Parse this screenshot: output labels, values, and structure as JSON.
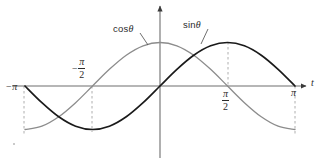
{
  "chart_data": {
    "type": "line",
    "title": "",
    "subtitle": "",
    "xlabel": "t",
    "ylabel": "",
    "xlim": [
      -3.141592653589793,
      3.141592653589793
    ],
    "ylim": [
      -1.15,
      1.15
    ],
    "grid": false,
    "legend_position": "inline-annotations",
    "x_tick_labels": [
      "−π",
      "−π/2",
      "π/2",
      "π"
    ],
    "x_tick_values": [
      -3.141592653589793,
      -1.5707963267948966,
      1.5707963267948966,
      3.141592653589793
    ],
    "series": [
      {
        "name": "cos θ",
        "color": "#8c8c8c",
        "linewidth": 1.3,
        "x": [
          -3.141592653589793,
          -2.748893571891069,
          -2.356194490192345,
          -1.9634954084936207,
          -1.5707963267948966,
          -1.1780972450961724,
          -0.7853981633974483,
          -0.39269908169872414,
          0,
          0.39269908169872414,
          0.7853981633974483,
          1.1780972450961724,
          1.5707963267948966,
          1.9634954084936207,
          2.356194490192345,
          2.748893571891069,
          3.141592653589793
        ],
        "y": [
          -1,
          -0.9238795325112867,
          -0.7071067811865476,
          -0.38268343236508984,
          0,
          0.38268343236508984,
          0.7071067811865476,
          0.9238795325112867,
          1,
          0.9238795325112867,
          0.7071067811865476,
          0.38268343236508984,
          0,
          -0.38268343236508984,
          -0.7071067811865476,
          -0.9238795325112867,
          -1
        ]
      },
      {
        "name": "sin θ",
        "color": "#1a1a1a",
        "linewidth": 1.7,
        "x": [
          -3.141592653589793,
          -2.748893571891069,
          -2.356194490192345,
          -1.9634954084936207,
          -1.5707963267948966,
          -1.1780972450961724,
          -0.7853981633974483,
          -0.39269908169872414,
          0,
          0.39269908169872414,
          0.7853981633974483,
          1.1780972450961724,
          1.5707963267948966,
          1.9634954084936207,
          2.356194490192345,
          2.748893571891069,
          3.141592653589793
        ],
        "y": [
          0,
          -0.38268343236508984,
          -0.7071067811865476,
          -0.9238795325112867,
          -1,
          -0.9238795325112867,
          -0.7071067811865476,
          -0.38268343236508984,
          0,
          0.38268343236508984,
          0.7071067811865476,
          0.9238795325112867,
          1,
          0.9238795325112867,
          0.7071067811865476,
          0.38268343236508984,
          0
        ]
      }
    ],
    "annotations": [
      {
        "text": "cos θ",
        "points_to": "cosine-curve"
      },
      {
        "text": "sin θ",
        "points_to": "sine-curve"
      }
    ],
    "dashed_guides_x": [
      -3.141592653589793,
      -1.5707963267948966,
      1.5707963267948966,
      3.141592653589793
    ]
  },
  "labels": {
    "cos_label": "cos",
    "sin_label": "sin",
    "theta_symbol": "θ",
    "axis_t": "t",
    "pi_symbol": "π",
    "two": "2",
    "minus": "−",
    "tick_minus_pi_sign": "−",
    "tick_minus_pi_symbol": "π"
  },
  "colors": {
    "cos_curve": "#8c8c8c",
    "sin_curve": "#1a1a1a",
    "axis": "#6e6e6e",
    "dashed_guide": "#9a9a9a",
    "text": "#2b2b2b",
    "background": "#ffffff"
  }
}
